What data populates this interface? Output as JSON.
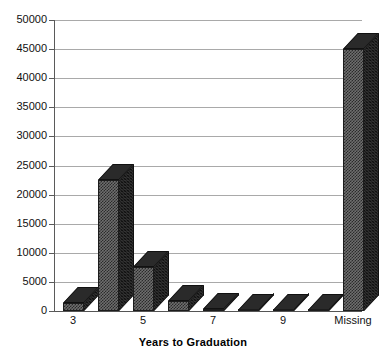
{
  "chart_data": {
    "type": "bar",
    "title": "",
    "xlabel": "Years to Graduation",
    "ylabel": "",
    "categories": [
      "3",
      "4",
      "5",
      "6",
      "7",
      "8",
      "9",
      "10",
      "Missing"
    ],
    "visible_tick_labels": [
      "3",
      "",
      "5",
      "",
      "7",
      "",
      "9",
      "",
      "Missing"
    ],
    "values": [
      1400,
      22500,
      7600,
      1800,
      300,
      200,
      150,
      100,
      45000
    ],
    "ylim": [
      0,
      50000
    ],
    "ytick_labels": [
      "0",
      "5000",
      "10000",
      "15000",
      "20000",
      "25000",
      "30000",
      "35000",
      "40000",
      "45000",
      "50000"
    ],
    "ytick_values": [
      0,
      5000,
      10000,
      15000,
      20000,
      25000,
      30000,
      35000,
      40000,
      45000,
      50000
    ],
    "grid": true,
    "legend": false,
    "style": "3d-bar",
    "colors": {
      "bar_face": "#6e6e6e",
      "bar_side": "#343434",
      "bar_top": "#2a2a2a",
      "gridline": "#a9a9a9",
      "axis": "#5a5a5a",
      "background": "#ffffff",
      "text": "#111111"
    }
  }
}
